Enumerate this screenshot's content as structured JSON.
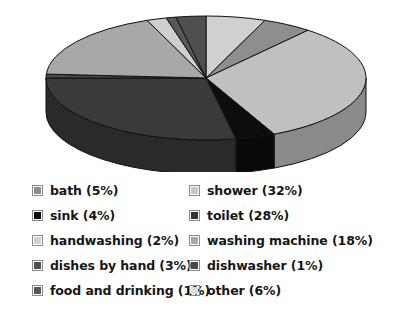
{
  "chart_data": {
    "type": "pie",
    "title": "",
    "subtitle": "",
    "xlabel": "",
    "ylabel": "",
    "legend_position": "bottom",
    "grid": false,
    "three_d": true,
    "unit": "%",
    "categories": [
      "other",
      "bath",
      "shower",
      "sink",
      "toilet",
      "dishwasher",
      "washing machine",
      "handwashing",
      "food and drinking",
      "dishes by hand"
    ],
    "values": [
      6,
      5,
      32,
      4,
      28,
      1,
      18,
      2,
      1,
      3
    ],
    "slices": [
      {
        "name": "other",
        "value": 6,
        "color": "#d0d0d0"
      },
      {
        "name": "bath",
        "value": 5,
        "color": "#8e8e8e"
      },
      {
        "name": "shower",
        "value": 32,
        "color": "#c0c0c0"
      },
      {
        "name": "sink",
        "value": 4,
        "color": "#0d0d0d"
      },
      {
        "name": "toilet",
        "value": 28,
        "color": "#3a3a3a"
      },
      {
        "name": "dishwasher",
        "value": 1,
        "color": "#4a4a4a"
      },
      {
        "name": "washing machine",
        "value": 18,
        "color": "#a8a8a8"
      },
      {
        "name": "handwashing",
        "value": 2,
        "color": "#cfcfcf"
      },
      {
        "name": "food and drinking",
        "value": 1,
        "color": "#585858"
      },
      {
        "name": "dishes by hand",
        "value": 3,
        "color": "#4f4f4f"
      }
    ]
  },
  "legend": {
    "rows": [
      {
        "left": {
          "label": "bath (5%)",
          "swatch_name": "swatch-bath",
          "color": "#8e8e8e"
        },
        "right": {
          "label": "shower (32%)",
          "swatch_name": "swatch-shower",
          "color": "#c6c6c6"
        }
      },
      {
        "left": {
          "label": "sink (4%)",
          "swatch_name": "swatch-sink",
          "color": "#0d0d0d"
        },
        "right": {
          "label": "toilet (28%)",
          "swatch_name": "swatch-toilet",
          "color": "#333333"
        }
      },
      {
        "left": {
          "label": "handwashing (2%)",
          "swatch_name": "swatch-handwashing",
          "color": "#cfcfcf"
        },
        "right": {
          "label": "washing machine (18%)",
          "swatch_name": "swatch-washing-machine",
          "color": "#a8a8a8"
        }
      },
      {
        "left": {
          "label": "dishes by hand (3%)",
          "swatch_name": "swatch-dishes-by-hand",
          "color": "#4f4f4f"
        },
        "right": {
          "label": "dishwasher (1%)",
          "swatch_name": "swatch-dishwasher",
          "color": "#4a4a4a"
        }
      },
      {
        "left": {
          "label": "food and drinking (1%)",
          "swatch_name": "swatch-food-and-drinking",
          "color": "#585858"
        },
        "right": {
          "label": "other (6%)",
          "swatch_name": "swatch-other",
          "color": "#dcdcdc"
        }
      }
    ]
  },
  "style": {
    "background": "#ffffff",
    "outline": "#111111",
    "text": "#161616"
  },
  "geometry": {
    "cx": 206,
    "cy": 78,
    "rx": 160,
    "ry": 62,
    "depth": 34,
    "start_angle": -90
  }
}
